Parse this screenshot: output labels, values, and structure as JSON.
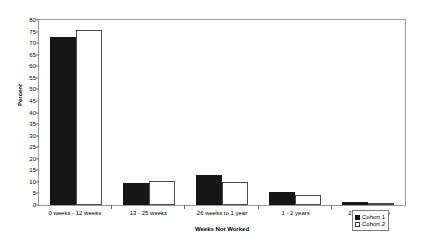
{
  "chart_data": {
    "type": "bar",
    "title": "",
    "subtitle": "",
    "xlabel": "Weeks Not Worked",
    "ylabel": "Percent",
    "categories": [
      "0 weeks - 12 weeks",
      "13 - 25 weeks",
      "26 weeks to 1 year",
      "1 - 2 years",
      "2 years or more"
    ],
    "series": [
      {
        "name": "Cohort 1",
        "color": "#161616",
        "values": [
          72.5,
          9.5,
          12.8,
          5.7,
          1.2
        ]
      },
      {
        "name": "Cohort 2",
        "color": "#ffffff",
        "values": [
          75.8,
          10.5,
          9.8,
          4.4,
          0.6
        ]
      }
    ],
    "ylim": [
      0,
      80
    ],
    "ytick_step": 5,
    "yticks": [
      0,
      5,
      10,
      15,
      20,
      25,
      30,
      35,
      40,
      45,
      50,
      55,
      60,
      65,
      70,
      75,
      80
    ],
    "grid": false,
    "legend_position": "bottom-right"
  },
  "legend": {
    "entries": [
      {
        "label": "Cohort 1"
      },
      {
        "label": "Cohort 2"
      }
    ]
  }
}
